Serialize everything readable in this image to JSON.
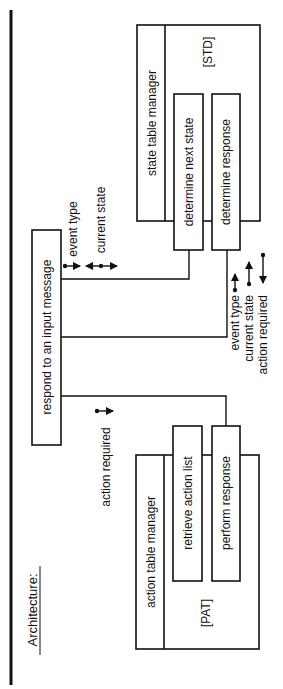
{
  "title": "Architecture:",
  "colors": {
    "ink": "#111111",
    "background": "#ffffff"
  },
  "nodes": {
    "respond": {
      "label": "respond to an input message"
    },
    "state_manager": {
      "label": "state table manager",
      "table_tag": "[STD]",
      "children": [
        {
          "label": "determine next state"
        },
        {
          "label": "determine response"
        }
      ]
    },
    "action_manager": {
      "label": "action table manager",
      "table_tag": "[PAT]",
      "children": [
        {
          "label": "retrieve action list"
        },
        {
          "label": "perform response"
        }
      ]
    }
  },
  "flows": {
    "to_state": [
      {
        "label": "event type",
        "icon": "arrow-out"
      },
      {
        "label": "current state",
        "icon": "arrow-bidirectional"
      }
    ],
    "to_action": [
      {
        "label": "action required",
        "icon": "arrow-out"
      }
    ]
  },
  "legend": [
    {
      "label": "event type",
      "icon": "arrow-up"
    },
    {
      "label": "current state",
      "icon": "arrow-up"
    },
    {
      "label": "action required",
      "icon": "arrow-down"
    }
  ]
}
